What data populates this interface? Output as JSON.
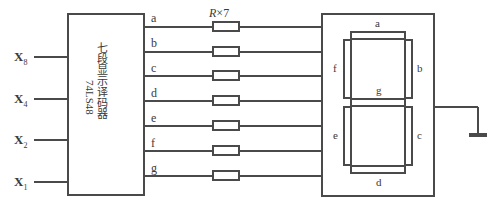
{
  "diagram": {
    "line_color": "#4a4a4a",
    "text_color": "#3a3a3a",
    "background": "#ffffff"
  },
  "decoder": {
    "name": "seven-segment-decoder",
    "label_cn": "七段显示译码器",
    "part_number": "74LS48",
    "box": {
      "x": 68,
      "y": 14,
      "w": 76,
      "h": 181
    }
  },
  "inputs": [
    {
      "name": "X8",
      "base": "X",
      "sub": "8",
      "y": 57
    },
    {
      "name": "X4",
      "base": "X",
      "sub": "4",
      "y": 99
    },
    {
      "name": "X2",
      "base": "X",
      "sub": "2",
      "y": 140
    },
    {
      "name": "X1",
      "base": "X",
      "sub": "1",
      "y": 182
    }
  ],
  "outputs": [
    {
      "name": "a",
      "label": "a",
      "y": 27
    },
    {
      "name": "b",
      "label": "b",
      "y": 52
    },
    {
      "name": "c",
      "label": "c",
      "y": 76
    },
    {
      "name": "d",
      "label": "d",
      "y": 101
    },
    {
      "name": "e",
      "label": "e",
      "y": 126
    },
    {
      "name": "f",
      "label": "f",
      "y": 151
    },
    {
      "name": "g",
      "label": "g",
      "y": 176
    }
  ],
  "resistors": {
    "label_r": "R",
    "label_times": "×",
    "label_count": "7",
    "label_full": "R×7",
    "count": 7,
    "width": 26,
    "height": 9,
    "center_x": 226
  },
  "display": {
    "name": "seven-segment-display",
    "box": {
      "x": 322,
      "y": 14,
      "w": 112,
      "h": 182
    },
    "segments": [
      {
        "id": "a",
        "label": "a",
        "orientation": "horizontal"
      },
      {
        "id": "b",
        "label": "b",
        "orientation": "vertical"
      },
      {
        "id": "c",
        "label": "c",
        "orientation": "vertical"
      },
      {
        "id": "d",
        "label": "d",
        "orientation": "horizontal"
      },
      {
        "id": "e",
        "label": "e",
        "orientation": "vertical"
      },
      {
        "id": "f",
        "label": "f",
        "orientation": "vertical"
      },
      {
        "id": "g",
        "label": "g",
        "orientation": "horizontal"
      }
    ]
  },
  "common": {
    "name": "common-ground",
    "symbol": "ground-bar"
  }
}
